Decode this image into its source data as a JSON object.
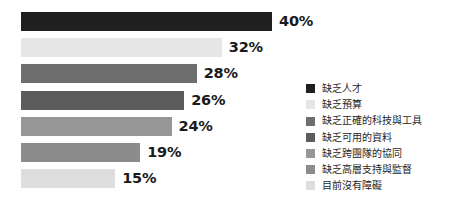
{
  "chart_data": {
    "type": "bar",
    "orientation": "horizontal",
    "title": "",
    "subtitle": "",
    "xlabel": "",
    "ylabel": "",
    "grid": false,
    "axis_visible": false,
    "legend_position": "right",
    "value_suffix": "%",
    "xlim": [
      0,
      40
    ],
    "categories": [
      "缺乏人才",
      "缺乏預算",
      "缺乏正確的科技與工具",
      "缺乏可用的資料",
      "缺乏跨團隊的協同",
      "缺乏高層支持與監督",
      "目前沒有障礙"
    ],
    "values": [
      40,
      32,
      28,
      26,
      24,
      19,
      15
    ],
    "data_labels": [
      "40%",
      "32%",
      "28%",
      "26%",
      "24%",
      "19%",
      "15%"
    ],
    "colors": [
      "#1f1f1f",
      "#e6e6e6",
      "#6e6e6e",
      "#5c5c5c",
      "#969696",
      "#8c8c8c",
      "#dedede"
    ],
    "bars": [
      {
        "label": "缺乏人才",
        "value": 40,
        "data_label": "40%",
        "color": "#1f1f1f"
      },
      {
        "label": "缺乏預算",
        "value": 32,
        "data_label": "32%",
        "color": "#e6e6e6"
      },
      {
        "label": "缺乏正確的科技與工具",
        "value": 28,
        "data_label": "28%",
        "color": "#6e6e6e"
      },
      {
        "label": "缺乏可用的資料",
        "value": 26,
        "data_label": "26%",
        "color": "#5c5c5c"
      },
      {
        "label": "缺乏跨團隊的協同",
        "value": 24,
        "data_label": "24%",
        "color": "#969696"
      },
      {
        "label": "缺乏高層支持與監督",
        "value": 19,
        "data_label": "19%",
        "color": "#8c8c8c"
      },
      {
        "label": "目前沒有障礙",
        "value": 15,
        "data_label": "15%",
        "color": "#dedede"
      }
    ],
    "legend": [
      {
        "label": "缺乏人才",
        "color": "#1f1f1f"
      },
      {
        "label": "缺乏預算",
        "color": "#e6e6e6"
      },
      {
        "label": "缺乏正確的科技與工具",
        "color": "#6e6e6e"
      },
      {
        "label": "缺乏可用的資料",
        "color": "#5c5c5c"
      },
      {
        "label": "缺乏跨團隊的協同",
        "color": "#969696"
      },
      {
        "label": "缺乏高層支持與監督",
        "color": "#8c8c8c"
      },
      {
        "label": "目前沒有障礙",
        "color": "#dedede"
      }
    ],
    "background_color": "#ffffff",
    "label_text_color": "#1a1a1a"
  }
}
